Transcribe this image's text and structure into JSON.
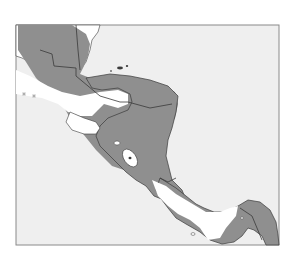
{
  "map": {
    "region": "Central America",
    "colors": {
      "background": "#ffffff",
      "sea": "#efefef",
      "frame": "#8a8a8a",
      "shaded_land": "#8f8f8f",
      "unshaded_land": "#ffffff",
      "border": "#3a3a3a"
    },
    "legend": null
  }
}
